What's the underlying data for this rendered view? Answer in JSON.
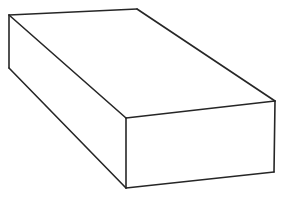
{
  "figure": {
    "shape_name": "rectangular-prism",
    "projection": "oblique-parallel",
    "background_color": "#ffffff",
    "stroke_color": "#262626",
    "fill_color": "#ffffff",
    "stroke_width": 1.6,
    "canvas": {
      "width": 284,
      "height": 198
    },
    "vertices": {
      "rear_top_left": {
        "x": 9,
        "y": 15
      },
      "rear_top_right": {
        "x": 137,
        "y": 9
      },
      "front_top_right": {
        "x": 275,
        "y": 101
      },
      "front_top_left": {
        "x": 126,
        "y": 118
      },
      "rear_bottom_left": {
        "x": 9,
        "y": 68
      },
      "front_bottom_left": {
        "x": 126,
        "y": 188
      },
      "front_bottom_right": {
        "x": 274,
        "y": 172
      }
    },
    "faces": [
      {
        "name": "top-face",
        "points": "9,15 137,9 275,101 126,118"
      },
      {
        "name": "left-face",
        "points": "9,15 126,118 126,188 9,68"
      },
      {
        "name": "front-face",
        "points": "126,118 275,101 274,172 126,188"
      }
    ],
    "edges": [
      {
        "name": "edge-rear-top",
        "d": "M 9,15 L 137,9"
      },
      {
        "name": "edge-top-right-receding",
        "d": "M 137,9 L 275,101"
      },
      {
        "name": "edge-front-top",
        "d": "M 126,118 L 275,101"
      },
      {
        "name": "edge-top-left-receding",
        "d": "M 9,15 L 126,118"
      },
      {
        "name": "edge-rear-left-vertical",
        "d": "M 9,15 L 9,68"
      },
      {
        "name": "edge-bottom-left-receding",
        "d": "M 9,68 L 126,188"
      },
      {
        "name": "edge-front-left-vertical",
        "d": "M 126,118 L 126,188"
      },
      {
        "name": "edge-front-bottom",
        "d": "M 126,188 L 274,172"
      },
      {
        "name": "edge-front-right-vertical",
        "d": "M 275,101 L 274,172"
      }
    ]
  }
}
